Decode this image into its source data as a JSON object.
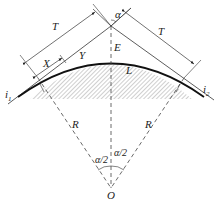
{
  "diagram": {
    "type": "vertical-curve-geometry",
    "labels": {
      "alpha": "α",
      "tangent_left": "T",
      "tangent_right": "T",
      "x_dim": "X",
      "y_dim": "Y",
      "external": "E",
      "curve_length": "L",
      "grade_left": "i",
      "grade_left_sub": "1",
      "grade_right": "i",
      "grade_right_sub": "2",
      "radius_left": "R",
      "radius_right": "R",
      "half_angle_left": "α/2",
      "half_angle_right": "α/2",
      "center": "O"
    },
    "colors": {
      "line": "#333333",
      "curve": "#111111",
      "hatch": "#888888",
      "background": "#ffffff"
    }
  }
}
